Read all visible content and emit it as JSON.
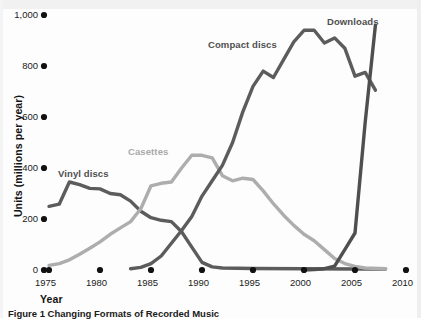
{
  "figure": {
    "caption": "Figure 1 Changing Formats of Recorded Music"
  },
  "chart_data": {
    "type": "line",
    "title": "",
    "subtitle": "",
    "xlabel": "Year",
    "ylabel": "Units (millions per year)",
    "xlim": [
      1975,
      2010
    ],
    "ylim": [
      0,
      1000
    ],
    "grid": false,
    "legend_position": "inline-annotations",
    "xticks": [
      "1975",
      "1980",
      "1985",
      "1990",
      "1995",
      "2000",
      "2005",
      "2010"
    ],
    "xtick_values": [
      1975,
      1980,
      1985,
      1990,
      1995,
      2000,
      2005,
      2010
    ],
    "yticks": [
      "0",
      "200",
      "400",
      "600",
      "800",
      "1,000"
    ],
    "ytick_values": [
      0,
      200,
      400,
      600,
      800,
      1000
    ],
    "tick_marker_style": "filled-circle",
    "annotations": [
      {
        "text": "Vinyl discs",
        "series": "Vinyl discs",
        "color": "#4f4f4f"
      },
      {
        "text": "Casettes",
        "series": "Casettes",
        "color": "#a9a9a9"
      },
      {
        "text": "Compact discs",
        "series": "Compact discs",
        "color": "#4f4f4f"
      },
      {
        "text": "Downloads",
        "series": "Downloads",
        "color": "#4f4f4f"
      }
    ],
    "series": [
      {
        "name": "Vinyl discs",
        "color": "#5c5c5c",
        "x": [
          1975,
          1976,
          1977,
          1978,
          1979,
          1980,
          1981,
          1982,
          1983,
          1984,
          1985,
          1986,
          1987,
          1988,
          1989,
          1990,
          1991,
          1992,
          1995,
          2000,
          2005,
          2008
        ],
        "values": [
          250,
          258,
          345,
          335,
          320,
          318,
          300,
          295,
          270,
          230,
          205,
          195,
          190,
          150,
          90,
          30,
          12,
          8,
          6,
          5,
          4,
          4
        ]
      },
      {
        "name": "Casettes",
        "color": "#adadad",
        "x": [
          1975,
          1976,
          1977,
          1978,
          1979,
          1980,
          1981,
          1982,
          1983,
          1984,
          1985,
          1986,
          1987,
          1988,
          1989,
          1990,
          1991,
          1992,
          1993,
          1994,
          1995,
          1996,
          1997,
          1998,
          1999,
          2000,
          2001,
          2002,
          2003,
          2004,
          2005,
          2006,
          2008
        ],
        "values": [
          18,
          25,
          40,
          62,
          85,
          110,
          140,
          165,
          190,
          240,
          330,
          340,
          345,
          400,
          450,
          450,
          440,
          370,
          350,
          360,
          355,
          310,
          260,
          215,
          175,
          140,
          115,
          80,
          45,
          25,
          14,
          8,
          5
        ]
      },
      {
        "name": "Compact discs",
        "color": "#5c5c5c",
        "x": [
          1983,
          1984,
          1985,
          1986,
          1987,
          1988,
          1989,
          1990,
          1991,
          1992,
          1993,
          1994,
          1995,
          1996,
          1997,
          1998,
          1999,
          2000,
          2001,
          2002,
          2003,
          2004,
          2005,
          2006,
          2007
        ],
        "values": [
          5,
          10,
          25,
          55,
          105,
          155,
          210,
          290,
          350,
          410,
          500,
          620,
          720,
          780,
          755,
          825,
          895,
          940,
          940,
          890,
          910,
          870,
          760,
          775,
          705
        ]
      },
      {
        "name": "Downloads",
        "color": "#4f4f4f",
        "x": [
          2000,
          2001,
          2002,
          2003,
          2004,
          2005,
          2006,
          2007
        ],
        "values": [
          0,
          2,
          5,
          15,
          80,
          145,
          580,
          960
        ]
      }
    ]
  }
}
